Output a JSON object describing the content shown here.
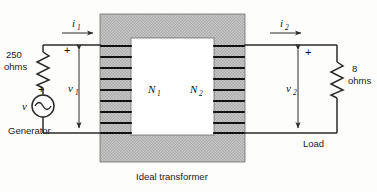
{
  "figure": {
    "caption": "Ideal transformer",
    "background": "#fdfdfb",
    "wire_color": "#2b2b2b",
    "core_fill": "#c9c9c9"
  },
  "source": {
    "symbol_name": "ac-voltage-source",
    "voltage_label": "v",
    "polarity_plus": "+",
    "side_label": "Generator"
  },
  "source_resistor": {
    "value": "250",
    "unit": "ohms",
    "polarity_plus": "+"
  },
  "load_resistor": {
    "value": "8",
    "unit": "ohms",
    "side_label": "Load"
  },
  "primary": {
    "current_label": "i",
    "current_sub": "1",
    "voltage_label": "v",
    "voltage_sub": "1",
    "turns_label": "N",
    "turns_sub": "1",
    "polarity_plus": "+",
    "turns_count": 8
  },
  "secondary": {
    "current_label": "i",
    "current_sub": "2",
    "voltage_label": "v",
    "voltage_sub": "2",
    "turns_label": "N",
    "turns_sub": "2",
    "polarity_plus": "+",
    "turns_count": 8
  }
}
